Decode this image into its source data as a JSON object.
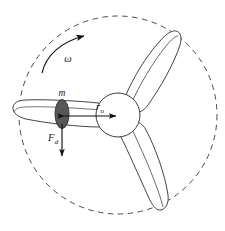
{
  "figure": {
    "background_color": "#ffffff",
    "width": 225,
    "height": 231
  },
  "labels": {
    "omega": "ω",
    "mass": "m",
    "radius_symbol": "r",
    "radius_subscript": "u",
    "force_symbol": "F",
    "force_subscript": "d"
  },
  "colors": {
    "stroke": "#3a3a3a",
    "blade_fill": "#ffffff",
    "hub_fill": "#ffffff",
    "mass_fill": "#575757",
    "mass_stroke": "#2b2b2b",
    "dashed_circle": "#4a4a4a",
    "arrow": "#111111",
    "text": "#1a1a1a"
  },
  "geometry": {
    "hub_center_x": 118,
    "hub_center_y": 115,
    "hub_radius": 22,
    "swept_circle_radius": 99,
    "mass_center_x": 62,
    "mass_center_y": 114,
    "mass_rx": 7,
    "mass_ry": 14,
    "blade_count": 3
  },
  "elements": {
    "swept_circle_name": "swept-area-dashed-circle",
    "hub_name": "rotor-hub",
    "blade_upper_right": "blade-upper-right",
    "blade_lower_right": "blade-lower-right",
    "blade_left": "blade-left",
    "mass_name": "unbalanced-mass",
    "radius_arrow_name": "radius-dimension-arrow",
    "force_arrow_name": "force-arrow",
    "rotation_arrow_name": "rotation-direction-arrow"
  }
}
